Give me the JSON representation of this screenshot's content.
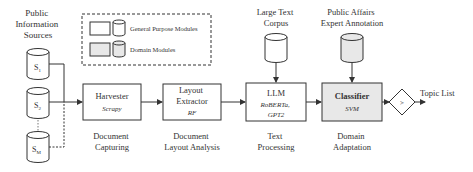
{
  "sources": {
    "title_lines": [
      "Public",
      "Information",
      "Sources"
    ],
    "items": [
      {
        "label": "S",
        "sub": "1"
      },
      {
        "label": "S",
        "sub": "2"
      },
      {
        "label": "S",
        "sub": "M"
      }
    ],
    "ellipsis": "⋮"
  },
  "legend": {
    "general": "General Purpose Modules",
    "domain": "Domain Modules"
  },
  "modules": [
    {
      "name": "Harvester",
      "sub": "Scrapy",
      "caption": [
        "Document",
        "Capturing"
      ]
    },
    {
      "name": "Layout",
      "name2": "Extractor",
      "sub": "RF",
      "caption": [
        "Document",
        "Layout Analysis"
      ]
    },
    {
      "name": "LLM",
      "sub": "RoBERTa,",
      "sub2": "GPT2",
      "caption": [
        "Text",
        "Processing"
      ]
    },
    {
      "name": "Classifier",
      "sub": "SVM",
      "caption": [
        "Domain",
        "Adaptation"
      ]
    }
  ],
  "inputs": {
    "corpus": [
      "Large Text",
      "Corpus"
    ],
    "annotation": [
      "Public Affairs",
      "Expert Annotation"
    ]
  },
  "decision": {
    "symbol": ">"
  },
  "output": {
    "label": "Topic List"
  },
  "colors": {
    "domain_fill": "#e8e8e8",
    "line": "#333333"
  }
}
